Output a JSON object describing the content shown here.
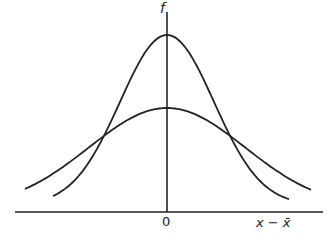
{
  "diagram": {
    "y_axis_label": "f",
    "x_origin_label": "0",
    "x_axis_label": "x − x̄",
    "curves": [
      {
        "name": "narrow-distribution",
        "peak_y_px": 35
      },
      {
        "name": "wide-distribution",
        "peak_y_px": 108
      }
    ],
    "line_color": "#222222"
  }
}
